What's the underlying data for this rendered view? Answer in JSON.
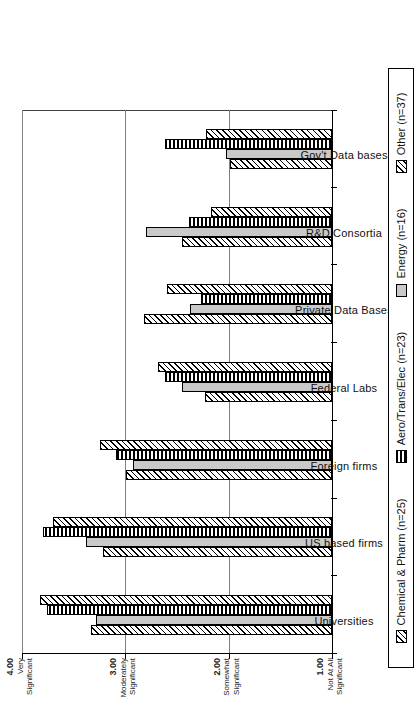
{
  "chart_data": {
    "type": "bar",
    "title": "",
    "xlabel": "Source",
    "ylabel": "",
    "orientation": "vertical-grouped-rotated-90",
    "ylim": [
      1.0,
      4.0
    ],
    "grid": true,
    "legend_position": "bottom",
    "categories": [
      "Universities",
      "US based firms",
      "Foreign firms",
      "Federal Labs",
      "Private Data Bases",
      "R&D Consortia",
      "Gov't Data bases"
    ],
    "tick_values": [
      "1.00",
      "2.00",
      "3.00",
      "4.00"
    ],
    "tick_labels": [
      {
        "value": "1.00",
        "line1": "Not At All",
        "line2": "Significant"
      },
      {
        "value": "2.00",
        "line1": "Somewhat",
        "line2": "Significant"
      },
      {
        "value": "3.00",
        "line1": "Moderately",
        "line2": "Significant"
      },
      {
        "value": "4.00",
        "line1": "Very",
        "line2": "Significant"
      }
    ],
    "series": [
      {
        "name": "Chemical & Pharm",
        "legend": "Chemical & Pharm  (n=25)",
        "n": 25,
        "pattern": "diagonal-hatch",
        "values": [
          3.33,
          3.22,
          2.99,
          2.23,
          2.82,
          2.45,
          1.99
        ]
      },
      {
        "name": "Energy",
        "legend": "Energy  (n=16)",
        "n": 16,
        "pattern": "solid-gray",
        "values": [
          3.28,
          3.38,
          2.93,
          2.45,
          2.37,
          2.8,
          2.03
        ]
      },
      {
        "name": "Aero/Trans/Elec",
        "legend": "Aero/Trans/Elec  (n=23)",
        "n": 23,
        "pattern": "horizontal-lines",
        "values": [
          3.76,
          3.8,
          3.09,
          2.62,
          2.27,
          2.38,
          2.62
        ]
      },
      {
        "name": "Other",
        "legend": "Other  (n=37)",
        "n": 37,
        "pattern": "diagonal-hatch",
        "values": [
          3.83,
          3.7,
          3.25,
          2.68,
          2.6,
          2.17,
          2.22
        ]
      }
    ]
  },
  "legend": {
    "items": [
      {
        "label": "Chemical & Pharm  (n=25)",
        "pattern": "diagonal-hatch"
      },
      {
        "label": "Aero/Trans/Elec  (n=23)",
        "pattern": "horizontal-lines"
      },
      {
        "label": "Energy  (n=16)",
        "pattern": "solid-gray"
      },
      {
        "label": "Other  (n=37)",
        "pattern": "diagonal-hatch"
      }
    ]
  }
}
